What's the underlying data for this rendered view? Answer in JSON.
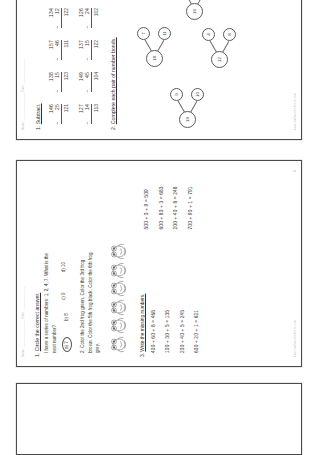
{
  "document": {
    "type": "math-worksheet-scan",
    "orientation": "rotated-90-ccw",
    "page_count_visible": 3
  },
  "page_top": {
    "header_left": "Name: _______________ Date: _____________",
    "header_right": "",
    "footer": "www.mathworksheets.com",
    "page_number": "5",
    "q1": {
      "number": "1.",
      "title": "Subtract.",
      "problems": [
        {
          "top": "146",
          "bottom": "25",
          "answer": "121"
        },
        {
          "top": "138",
          "bottom": "15",
          "answer": "123"
        },
        {
          "top": "157",
          "bottom": "46",
          "answer": "111"
        },
        {
          "top": "134",
          "bottom": "12",
          "answer": "122"
        },
        {
          "top": "159",
          "bottom": "47",
          "answer": "112"
        },
        {
          "top": "127",
          "bottom": "14",
          "answer": "113"
        },
        {
          "top": "149",
          "bottom": "45",
          "answer": "104"
        },
        {
          "top": "137",
          "bottom": "15",
          "answer": "122"
        },
        {
          "top": "126",
          "bottom": "24",
          "answer": "102"
        },
        {
          "top": "138",
          "bottom": "31",
          "answer": "107"
        }
      ],
      "minus_sign": "−"
    },
    "q2": {
      "number": "2.",
      "title": "Complete each pair of number bonds.",
      "bonds": [
        {
          "parent": "19",
          "child1": "9",
          "child2": "10"
        },
        {
          "parent": "18",
          "child1": "7",
          "child2": "11"
        },
        {
          "parent": "16",
          "child1": "4",
          "child2": "12"
        },
        {
          "parent": "14",
          "child1": "6",
          "child2": "8"
        },
        {
          "parent": "17",
          "child1": "5",
          "child2": "12"
        },
        {
          "parent": "15",
          "child1": "6",
          "child2": "9"
        },
        {
          "parent": "13",
          "child1": "5",
          "child2": "8"
        },
        {
          "parent": "12",
          "child1": "4",
          "child2": "8"
        }
      ]
    }
  },
  "page_mid": {
    "header_left": "Name: _______________ Date: _____________",
    "footer": "www.mathworksheets.com",
    "page_number": "6",
    "q1": {
      "number": "1.",
      "title": "Circle the correct answer.",
      "question_line1": "I have a series of numbers:  1, 2, 4, 7. ",
      "question_underline": "What is the",
      "question_line2": "next number?",
      "options": [
        {
          "label": "a)",
          "value": "7",
          "circled": true
        },
        {
          "label": "b)",
          "value": "8",
          "circled": false
        },
        {
          "label": "c)",
          "value": "9",
          "circled": false
        },
        {
          "label": "d)",
          "value": "10",
          "circled": false
        }
      ]
    },
    "q2": {
      "number": "2.",
      "line1_a": "Color",
      "line1_b": " the 2nd frog green. ",
      "line1_c": "Color",
      "line1_d": " the 3rd frog",
      "line2_a": "brown. ",
      "line2_b": "Color",
      "line2_c": " the 5th frog black. ",
      "line2_d": "Color",
      "line2_e": " the 6th frog",
      "line3": "grey.",
      "frog_count": 6
    },
    "q3": {
      "number": "3.",
      "title": "Write the missing numbers.",
      "equations_left": [
        "400 + 60 + 8 = 468",
        "100 + 30 + 5 = 135",
        "200 + 40 + 5 = 245",
        "600 + 20 + 1 = 621"
      ],
      "equations_right": [
        "500 + 0 + 9 = 509",
        "600 + 80 + 3 = 683",
        "200 + 40 + 8 = 248",
        "700 + 90 + 1 = 791"
      ]
    }
  },
  "page_bot": {
    "content": ""
  }
}
